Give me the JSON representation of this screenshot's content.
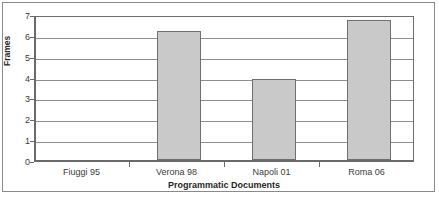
{
  "chart_data": {
    "type": "bar",
    "title": "",
    "xlabel": "Programmatic Documents",
    "ylabel": "Frames",
    "categories": [
      "Fiuggi 95",
      "Verona 98",
      "Napoli 01",
      "Roma 06"
    ],
    "values": [
      0,
      6.2,
      3.9,
      6.7
    ],
    "ylim": [
      0,
      7
    ],
    "ytick_labels": [
      "0",
      "1",
      "2",
      "3",
      "4",
      "5",
      "6",
      "7"
    ],
    "ytick_values": [
      0,
      1,
      2,
      3,
      4,
      5,
      6,
      7
    ],
    "grid": "horizontal",
    "legend": "none",
    "bar_fill_color": "#c9c9c9",
    "bar_edge_color": "#6f6f6f",
    "gridline_color": "#8d8d8d",
    "axis_color": "#6a6a6a",
    "frame_color": "#8a8a8a",
    "background_color": "#ffffff"
  }
}
